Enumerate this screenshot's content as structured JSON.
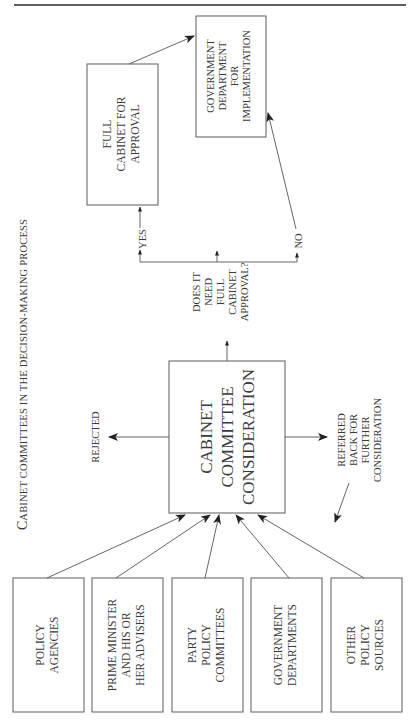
{
  "figure": {
    "title_initial": "C",
    "title_rest": "ABINET COMMITTEES IN THE DECISION-MAKING PROCESS",
    "title": "Cabinet committees in the decision-making process"
  },
  "sources": [
    {
      "id": "policy-agencies",
      "lines": [
        "POLICY",
        "AGENCIES"
      ]
    },
    {
      "id": "prime-minister",
      "lines": [
        "PRIME MINISTER",
        "AND HIS OR",
        "HER ADVISERS"
      ]
    },
    {
      "id": "party-policy-committees",
      "lines": [
        "PARTY",
        "POLICY",
        "COMMITTEES"
      ]
    },
    {
      "id": "government-departments",
      "lines": [
        "GOVERNMENT",
        "DEPARTMENTS"
      ]
    },
    {
      "id": "other-policy-sources",
      "lines": [
        "OTHER",
        "POLICY",
        "SOURCES"
      ]
    }
  ],
  "central": {
    "lines": [
      "CABINET",
      "COMMITTEE",
      "CONSIDERATION"
    ]
  },
  "outcomes": {
    "rejected": "REJECTED",
    "referred": [
      "REFERRED",
      "BACK FOR",
      "FURTHER",
      "CONSIDERATION"
    ]
  },
  "decision": {
    "lines": [
      "DOES IT",
      "NEED",
      "FULL",
      "CABINET",
      "APPROVAL?"
    ]
  },
  "branches": {
    "yes": "YES",
    "no": "NO"
  },
  "full_cabinet": {
    "lines": [
      "FULL",
      "CABINET FOR",
      "APPROVAL"
    ]
  },
  "implementation": {
    "lines": [
      "GOVERNMENT",
      "DEPARTMENT",
      "FOR",
      "IMPLEMENTATION"
    ]
  },
  "page_number": "2"
}
